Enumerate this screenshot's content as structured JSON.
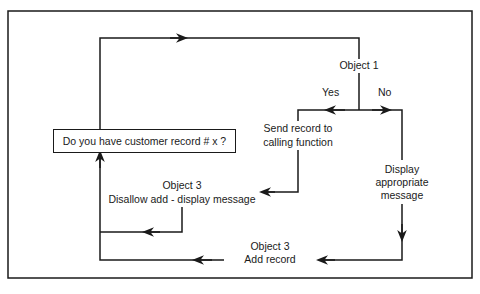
{
  "diagram": {
    "type": "flowchart",
    "colors": {
      "line": "#1a1a1a",
      "background": "#ffffff"
    },
    "decision": {
      "question": "Do you have customer record # x ?"
    },
    "object1": {
      "label": "Object 1",
      "yes_label": "Yes",
      "no_label": "No"
    },
    "send_record": {
      "line1": "Send record to",
      "line2": "calling function"
    },
    "disallow": {
      "object": "Object 3",
      "action": "Disallow add - display message"
    },
    "display_message": {
      "line1": "Display",
      "line2": "appropriate",
      "line3": "message"
    },
    "add_record": {
      "object": "Object 3",
      "action": "Add record"
    }
  }
}
